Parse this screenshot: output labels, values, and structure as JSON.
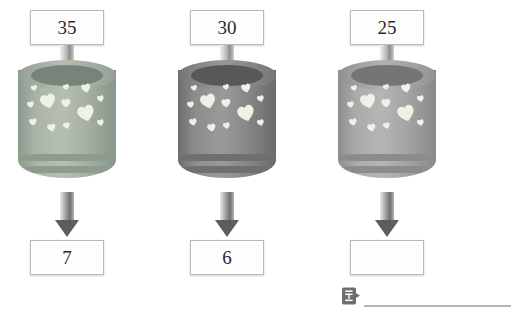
{
  "worksheet": {
    "type": "function-machine",
    "rule_description": "divide by 5",
    "machines": [
      {
        "input": "35",
        "output": "7",
        "machine_color": "#9aa79a",
        "machine_label": "heart-machine-1"
      },
      {
        "input": "30",
        "output": "6",
        "machine_color": "#7f7f7f",
        "machine_label": "heart-machine-2"
      },
      {
        "input": "25",
        "output": "",
        "machine_color": "#a3a3a3",
        "machine_label": "heart-machine-3"
      }
    ]
  },
  "answer": {
    "icon_label": "답",
    "icon_name": "answer-tag-icon",
    "value": ""
  },
  "colors": {
    "box_fill": "#fdfdfd",
    "box_border": "#b9b9b9",
    "arrow_dark": "#5d5d5d",
    "answer_line": "#b5b5b5",
    "heart_fill": "#eef1e6"
  }
}
